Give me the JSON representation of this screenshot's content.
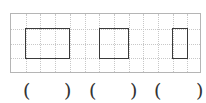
{
  "grid": {
    "cols": 13,
    "rows": 4,
    "line_color": "#c8c8c8",
    "border_color": "#b5b5b5"
  },
  "shapes": [
    {
      "name": "rectangle",
      "col": 1,
      "row": 1,
      "width_cells": 3,
      "height_cells": 2
    },
    {
      "name": "square",
      "col": 6,
      "row": 1,
      "width_cells": 2,
      "height_cells": 2
    },
    {
      "name": "rectangle",
      "col": 11,
      "row": 1,
      "width_cells": 1,
      "height_cells": 2
    }
  ],
  "answers": [
    {
      "open": "(",
      "close": ")",
      "value": ""
    },
    {
      "open": "(",
      "close": ")",
      "value": ""
    },
    {
      "open": "(",
      "close": ")",
      "value": ""
    }
  ]
}
